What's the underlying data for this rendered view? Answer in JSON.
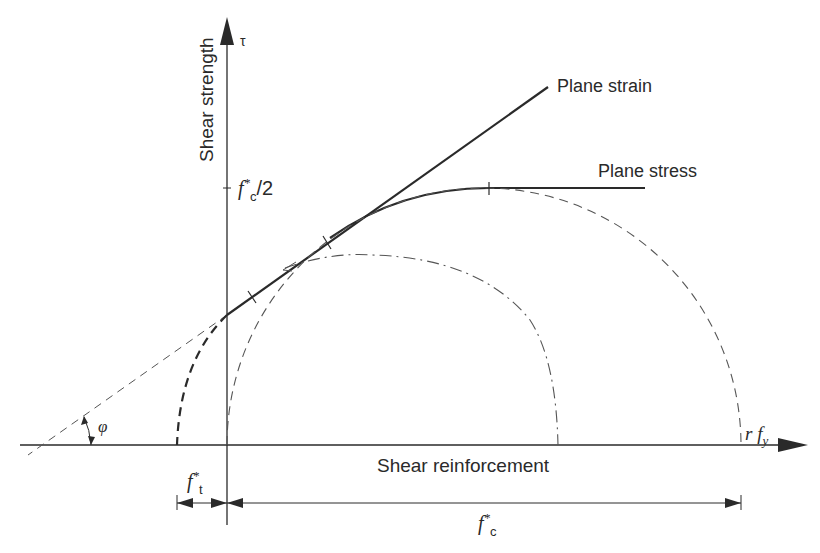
{
  "diagram": {
    "y_axis": {
      "label": "Shear strength",
      "symbol": "τ",
      "tick_label_main": "f",
      "tick_label_sup": "*",
      "tick_label_sub": "c",
      "tick_label_tail": "/2"
    },
    "x_axis": {
      "label": "Shear reinforcement",
      "end_label_r": "r f",
      "end_label_sub": "y"
    },
    "curves": {
      "plane_strain": "Plane strain",
      "plane_stress": "Plane stress"
    },
    "angle": {
      "symbol": "φ"
    },
    "dimensions": {
      "tension": {
        "main": "f",
        "sup": "*",
        "sub": "t"
      },
      "compression": {
        "main": "f",
        "sup": "*",
        "sub": "c"
      }
    },
    "colors": {
      "line": "#2a2a2a",
      "dashed": "#555555",
      "background": "#ffffff"
    }
  }
}
